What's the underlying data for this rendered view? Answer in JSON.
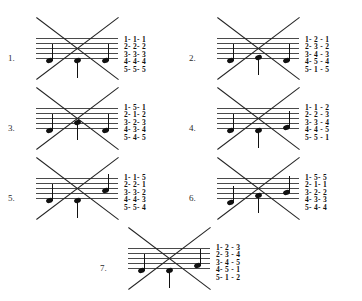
{
  "document": {
    "type": "music-theory-worksheet",
    "staff_line_count": 5,
    "notes_per_exercise": 3
  },
  "exercises": [
    {
      "label": "1.",
      "name": "exercise-1",
      "x": 8,
      "y": 18,
      "label_x": 0,
      "label_y": 36,
      "staff_x": 28,
      "staff_y": 20,
      "staff_w": 82,
      "numbers_x": 116,
      "numbers_y": 18,
      "notes": [
        {
          "x": 10,
          "step": 1,
          "stem": "up"
        },
        {
          "x": 38,
          "step": 1,
          "stem": "down"
        },
        {
          "x": 66,
          "step": 1,
          "stem": "up"
        }
      ],
      "number_rows": [
        "1- 1- 1",
        "2- 2- 2",
        "3- 3- 3",
        "4- 4- 4",
        "5- 5- 5"
      ]
    },
    {
      "label": "2.",
      "name": "exercise-2",
      "x": 189,
      "y": 18,
      "label_x": 0,
      "label_y": 36,
      "staff_x": 28,
      "staff_y": 20,
      "staff_w": 82,
      "numbers_x": 116,
      "numbers_y": 18,
      "notes": [
        {
          "x": 10,
          "step": 1,
          "stem": "up"
        },
        {
          "x": 38,
          "step": 2,
          "stem": "down"
        },
        {
          "x": 66,
          "step": 1,
          "stem": "up"
        }
      ],
      "number_rows": [
        "1- 2 - 1",
        "2- 3 - 2",
        "3- 4 - 3",
        "4- 5 - 4",
        "5- 1 - 5"
      ]
    },
    {
      "label": "3.",
      "name": "exercise-3",
      "x": 8,
      "y": 88,
      "label_x": 0,
      "label_y": 36,
      "staff_x": 28,
      "staff_y": 20,
      "staff_w": 82,
      "numbers_x": 116,
      "numbers_y": 16,
      "notes": [
        {
          "x": 10,
          "step": 1,
          "stem": "up"
        },
        {
          "x": 38,
          "step": 4,
          "stem": "down"
        },
        {
          "x": 66,
          "step": 1,
          "stem": "up"
        }
      ],
      "number_rows": [
        "1- 5- 1",
        "2- 1- 2",
        "3- 2- 3",
        "4- 3- 4",
        "5- 4- 5"
      ]
    },
    {
      "label": "4.",
      "name": "exercise-4",
      "x": 189,
      "y": 88,
      "label_x": 0,
      "label_y": 36,
      "staff_x": 28,
      "staff_y": 20,
      "staff_w": 82,
      "numbers_x": 116,
      "numbers_y": 16,
      "notes": [
        {
          "x": 10,
          "step": 1,
          "stem": "up"
        },
        {
          "x": 38,
          "step": 1,
          "stem": "down"
        },
        {
          "x": 66,
          "step": 2,
          "stem": "up"
        }
      ],
      "number_rows": [
        "1- 1 - 2",
        "2- 2 - 3",
        "3- 3 - 4",
        "4- 4 - 5",
        "5- 5 - 1"
      ]
    },
    {
      "label": "5.",
      "name": "exercise-5",
      "x": 8,
      "y": 158,
      "label_x": 0,
      "label_y": 36,
      "staff_x": 28,
      "staff_y": 20,
      "staff_w": 82,
      "numbers_x": 116,
      "numbers_y": 16,
      "notes": [
        {
          "x": 10,
          "step": 1,
          "stem": "up"
        },
        {
          "x": 38,
          "step": 1,
          "stem": "down"
        },
        {
          "x": 66,
          "step": 5,
          "stem": "up"
        }
      ],
      "number_rows": [
        "1- 1- 5",
        "2- 2- 1",
        "3- 3- 2",
        "4- 4- 3",
        "5- 5- 4"
      ]
    },
    {
      "label": "6.",
      "name": "exercise-6",
      "x": 189,
      "y": 158,
      "label_x": 0,
      "label_y": 36,
      "staff_x": 28,
      "staff_y": 20,
      "staff_w": 82,
      "numbers_x": 116,
      "numbers_y": 16,
      "notes": [
        {
          "x": 10,
          "step": 0,
          "stem": "up"
        },
        {
          "x": 38,
          "step": 3,
          "stem": "down"
        },
        {
          "x": 66,
          "step": 4,
          "stem": "up"
        }
      ],
      "number_rows": [
        "1- 5- 5",
        "2- 1- 1",
        "3- 2- 2",
        "4- 3- 3",
        "5- 4- 4"
      ]
    },
    {
      "label": "7.",
      "name": "exercise-7",
      "x": 100,
      "y": 228,
      "label_x": 0,
      "label_y": 36,
      "staff_x": 28,
      "staff_y": 20,
      "staff_w": 82,
      "numbers_x": 116,
      "numbers_y": 16,
      "notes": [
        {
          "x": 10,
          "step": 1,
          "stem": "up"
        },
        {
          "x": 38,
          "step": 1,
          "stem": "down"
        },
        {
          "x": 66,
          "step": 3,
          "stem": "up"
        }
      ],
      "number_rows": [
        "1- 2 - 3",
        "2- 3 - 4",
        "3- 4 - 5",
        "4- 5 - 1",
        "5- 1 - 2"
      ]
    }
  ]
}
